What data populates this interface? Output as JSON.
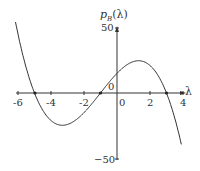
{
  "chart_data": {
    "type": "line",
    "title": "",
    "xlabel": "λ",
    "ylabel": "p_B(λ)",
    "xlim": [
      -6,
      4
    ],
    "ylim": [
      -50,
      50
    ],
    "x_ticks": [
      "-6",
      "-4",
      "-2",
      "0",
      "2",
      "4"
    ],
    "y_ticks": [
      "50",
      "-50"
    ],
    "origin_label": "0",
    "grid": false,
    "legend": null,
    "series": [
      {
        "name": "p_B(λ) = -(λ+5)(λ+1)(λ-3)",
        "x": [
          -6.2,
          -6,
          -5,
          -4,
          -3,
          -2,
          -1,
          0,
          1,
          2,
          3,
          4
        ],
        "y": [
          54.0,
          45,
          0,
          -15,
          -24,
          -21,
          0,
          15,
          24,
          21,
          0,
          -45
        ]
      }
    ],
    "marked_roots": [
      -5,
      -1,
      3
    ]
  },
  "labels": {
    "ylabel_main": "p",
    "ylabel_sub": "B",
    "ylabel_arg": "(λ)",
    "xlabel": "λ",
    "y_top": "50",
    "y_bottom": "−50",
    "origin": "0",
    "x_ticks": [
      "-6",
      "-4",
      "-2",
      "0",
      "2",
      "4"
    ]
  }
}
